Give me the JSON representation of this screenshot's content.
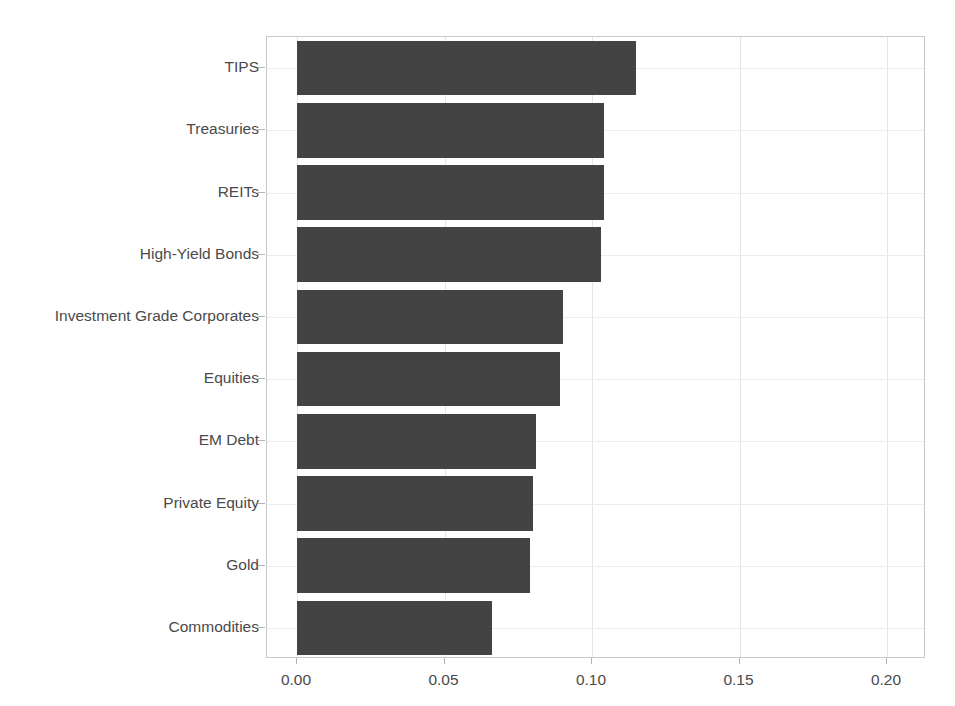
{
  "chart_data": {
    "type": "bar",
    "orientation": "horizontal",
    "title": "",
    "subtitle": "",
    "xlabel": "",
    "ylabel": "",
    "categories": [
      "TIPS",
      "Treasuries",
      "REITs",
      "High-Yield Bonds",
      "Investment Grade Corporates",
      "Equities",
      "EM Debt",
      "Private Equity",
      "Gold",
      "Commodities"
    ],
    "values": [
      0.115,
      0.104,
      0.104,
      0.103,
      0.09,
      0.089,
      0.081,
      0.08,
      0.079,
      0.066
    ],
    "xlim": [
      0.0,
      0.2233
    ],
    "xticks": [
      0.0,
      0.05,
      0.1,
      0.15,
      0.2
    ],
    "xtick_labels": [
      "0.00",
      "0.05",
      "0.10",
      "0.15",
      "0.20"
    ],
    "grid": true,
    "legend": null,
    "bar_color": "#434343",
    "axis_color": "#c9c9c9",
    "grid_color": "#e6e6e6",
    "tick_label_color": "#4a4a4a"
  }
}
